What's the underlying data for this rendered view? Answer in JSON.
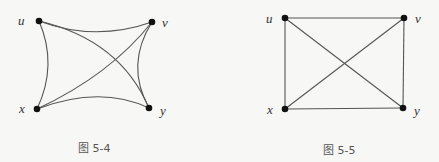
{
  "figures": [
    {
      "caption": "图 5-4",
      "vertices": [
        {
          "id": "u",
          "label": "u",
          "x": 39,
          "y": 21
        },
        {
          "id": "v",
          "label": "v",
          "x": 152,
          "y": 22
        },
        {
          "id": "x",
          "label": "x",
          "x": 37,
          "y": 109
        },
        {
          "id": "y",
          "label": "y",
          "x": 149,
          "y": 108
        }
      ],
      "edges": [
        {
          "from": "u",
          "to": "v",
          "style": "curve"
        },
        {
          "from": "u",
          "to": "x",
          "style": "curve"
        },
        {
          "from": "u",
          "to": "y",
          "style": "curve"
        },
        {
          "from": "v",
          "to": "x",
          "style": "straight"
        },
        {
          "from": "v",
          "to": "y",
          "style": "curve"
        },
        {
          "from": "x",
          "to": "y",
          "style": "curve"
        }
      ]
    },
    {
      "caption": "图 5-5",
      "vertices": [
        {
          "id": "u",
          "label": "u",
          "x": 285,
          "y": 18
        },
        {
          "id": "v",
          "label": "v",
          "x": 404,
          "y": 18
        },
        {
          "id": "x",
          "label": "x",
          "x": 285,
          "y": 109
        },
        {
          "id": "y",
          "label": "y",
          "x": 403,
          "y": 108
        }
      ],
      "edges": [
        {
          "from": "u",
          "to": "v",
          "style": "straight"
        },
        {
          "from": "u",
          "to": "x",
          "style": "straight"
        },
        {
          "from": "u",
          "to": "y",
          "style": "straight"
        },
        {
          "from": "v",
          "to": "x",
          "style": "straight"
        },
        {
          "from": "v",
          "to": "y",
          "style": "straight"
        },
        {
          "from": "x",
          "to": "y",
          "style": "straight"
        }
      ]
    }
  ]
}
